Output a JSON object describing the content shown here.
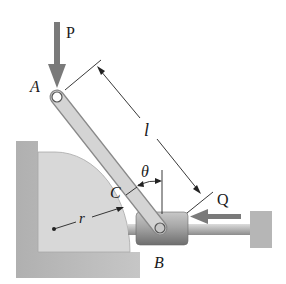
{
  "figure": {
    "labels": {
      "force_p": "P",
      "point_a": "A",
      "length": "l",
      "angle": "θ",
      "point_c": "C",
      "radius": "r",
      "force_q": "Q",
      "point_b": "B"
    },
    "colors": {
      "background": "#ffffff",
      "bar_fill": "#d6d6d6",
      "bar_stroke": "#8f8f8f",
      "wall_fill": "#bdbdbd",
      "block_fill": "#d9d9d9",
      "collar_fill": "#9a9a9a",
      "arrow_fill": "#7d7d7d",
      "line_color": "#222222"
    }
  }
}
